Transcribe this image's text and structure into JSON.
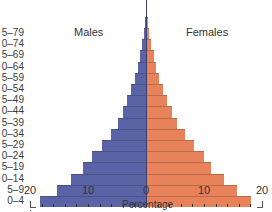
{
  "chart_data": {
    "type": "bar",
    "subtype": "population-pyramid",
    "title": "",
    "xlabel": "Percentage",
    "ylabel": "",
    "categories": [
      "0–4",
      "5–9",
      "10–14",
      "15–19",
      "20–24",
      "25–29",
      "30–34",
      "35–39",
      "40–44",
      "45–49",
      "50–54",
      "55–59",
      "60–64",
      "65–69",
      "70–74",
      "75–79",
      "80+"
    ],
    "visible_category_labels": [
      "0–4",
      "5–9",
      "0–14",
      "5–19",
      "0–24",
      "5–29",
      "0–34",
      "5–39",
      "0–44",
      "5–49",
      "0–54",
      "5–59",
      "0–64",
      "5–69",
      "0–74",
      "5–79"
    ],
    "series": [
      {
        "name": "Males",
        "color": "#5a63a6",
        "side": "left",
        "values": [
          18.3,
          15.3,
          13.0,
          10.9,
          9.3,
          7.6,
          6.0,
          4.8,
          4.0,
          3.3,
          2.6,
          1.9,
          1.4,
          1.0,
          0.7,
          0.4,
          0.2
        ]
      },
      {
        "name": "Females",
        "color": "#e8825a",
        "side": "right",
        "values": [
          18.1,
          15.7,
          13.4,
          11.2,
          10.0,
          8.3,
          6.7,
          5.3,
          4.5,
          3.6,
          2.9,
          2.2,
          1.7,
          1.3,
          0.9,
          0.6,
          0.3
        ]
      }
    ],
    "x_ticks": [
      "20",
      "10",
      "0",
      "10",
      "20"
    ],
    "xlim": [
      -20,
      20
    ],
    "grid": false,
    "legend": {
      "position": "inline",
      "entries": [
        "Males",
        "Females"
      ]
    }
  },
  "labels": {
    "males": "Males",
    "females": "Females",
    "xlabel": "Percentage",
    "tick_20_left": "20",
    "tick_10_left": "10",
    "tick_0": "0",
    "tick_10_right": "10",
    "tick_20_right": "20"
  }
}
